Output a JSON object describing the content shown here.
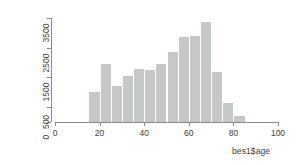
{
  "chart_data": {
    "type": "bar",
    "title": "",
    "subtitle": "",
    "xlabel": "bes1$age",
    "ylabel": "frequency",
    "grid": false,
    "legend": false,
    "xlim": [
      0,
      100
    ],
    "ylim": [
      0,
      3500
    ],
    "bin_width": 5,
    "x_ticks": [
      0,
      20,
      40,
      60,
      80,
      100
    ],
    "x_tick_labels": [
      "0",
      "20",
      "40",
      "60",
      "80",
      "100"
    ],
    "y_ticks": [
      0,
      500,
      1500,
      2500,
      3500
    ],
    "y_tick_labels": [
      "0",
      "500",
      "1500",
      "2500",
      "3500"
    ],
    "bin_starts": [
      15,
      20,
      25,
      30,
      35,
      40,
      45,
      50,
      55,
      60,
      65,
      70,
      75,
      80
    ],
    "bin_ends": [
      20,
      25,
      30,
      35,
      40,
      45,
      50,
      55,
      60,
      65,
      70,
      75,
      80,
      85
    ],
    "categories": [
      "15-20",
      "20-25",
      "25-30",
      "30-35",
      "35-40",
      "40-45",
      "45-50",
      "50-55",
      "55-60",
      "60-65",
      "65-70",
      "70-75",
      "75-80",
      "80-85"
    ],
    "values": [
      1000,
      1950,
      1200,
      1560,
      1780,
      1740,
      1950,
      2350,
      2850,
      2900,
      3350,
      1680,
      650,
      200
    ],
    "bar_color": "#c4c8c6",
    "axis_color": "#8a8a8a"
  },
  "axes": {
    "y_title": "frequency",
    "x_title": "bes1$age"
  }
}
